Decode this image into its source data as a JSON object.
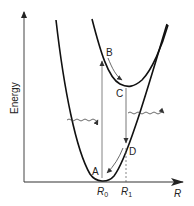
{
  "diagram": {
    "axes": {
      "y_label": "Energy",
      "x_label": "R",
      "x_ticks": [
        {
          "label": "R",
          "sub": "0"
        },
        {
          "label": "R",
          "sub": "1"
        }
      ]
    },
    "points": {
      "A": "A",
      "B": "B",
      "C": "C",
      "D": "D"
    },
    "curves": [
      {
        "name": "ground-state-curve",
        "minimum": "R0"
      },
      {
        "name": "excited-state-curve",
        "minimum": "R1"
      }
    ],
    "transitions": [
      {
        "name": "absorption",
        "from": "A",
        "to": "B",
        "direction": "up"
      },
      {
        "name": "relaxation-excited",
        "from": "B",
        "to": "C"
      },
      {
        "name": "emission",
        "from": "C",
        "to": "D",
        "direction": "down"
      },
      {
        "name": "relaxation-ground",
        "from": "D",
        "to": "A"
      }
    ],
    "photons": [
      {
        "name": "incoming-photon",
        "direction": "right"
      },
      {
        "name": "outgoing-photon",
        "direction": "right"
      }
    ],
    "colors": {
      "curve": "#111111",
      "axis": "#333333",
      "transition": "#555555"
    }
  }
}
